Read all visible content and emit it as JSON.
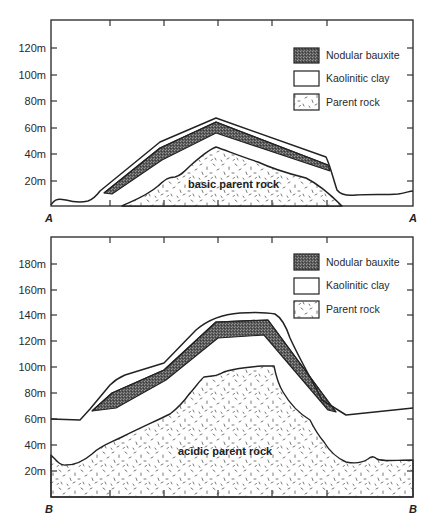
{
  "legend": {
    "items": [
      {
        "label": "Nodular bauxite",
        "pattern": "dark-stipple"
      },
      {
        "label": "Kaolinitic clay",
        "pattern": "white"
      },
      {
        "label": "Parent rock",
        "pattern": "dashes"
      }
    ]
  },
  "section_a": {
    "left_label": "A",
    "right_label": "A",
    "rock_label": "basic parent rock",
    "y_ticks": [
      "120m",
      "100m",
      "80m",
      "60m",
      "40m",
      "20m"
    ]
  },
  "section_b": {
    "left_label": "B",
    "right_label": "B",
    "rock_label": "acidic parent rock",
    "y_ticks": [
      "180m",
      "160m",
      "140m",
      "120m",
      "100m",
      "80m",
      "60m",
      "40m",
      "20m"
    ]
  },
  "colors": {
    "bauxite": "#555555",
    "line": "#222222",
    "background": "#ffffff"
  }
}
